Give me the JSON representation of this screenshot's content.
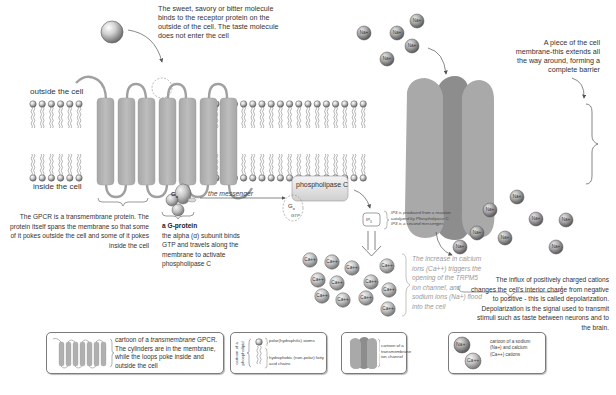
{
  "labels": {
    "outside_cell": "outside the cell",
    "inside_cell": "inside the cell",
    "phospholipase": "phospholipase C",
    "messenger": "the messenger",
    "g_alpha": "G",
    "g_alpha_sub": "α",
    "gtp": "GTP",
    "ip3": "IP",
    "ip3_sub": "3"
  },
  "annotations": {
    "taste_molecule": "The sweet, savory or bitter molecule binds to the receptor protein on the outside of the cell. The taste molecule does not enter the cell",
    "membrane_piece": "A piece of the cell membrane-this extends all the way around, forming a complete barrier",
    "gpcr": "The GPCR is a transmembrane protein. The protein itself spans the membrane so that some of it pokes outside the cell and some of it pokes inside the cell",
    "g_protein_title": "a G-protein",
    "g_protein_desc": "the alpha (α) subunit binds GTP and travels along the membrane to activate phospholipase C",
    "ip3_note": "IP3 is produced from a reaction catalyzed by Phospholipase C. IP3 is a second messenger.",
    "calcium_note": "The increase in calcium ions (Ca++) triggers the opening of the TRPM5 ion channel, and sodium ions (Na+) flood into the cell",
    "depolarization": "The influx of positively charged cations changes the cell's interior charge from negative to positive - this is called depolarization. Depolarization is the signal used to transmit stimuli such as taste between neurons and to the brain."
  },
  "ions": {
    "na": "Na+",
    "ca": "Ca++"
  },
  "legend": [
    {
      "id": "gpcr",
      "text_pre": "cartoon of a ",
      "text_em": "transmembrane",
      "text_post": " GPCR. The cylinders are in the membrane, while the loops poke inside and outside the cell"
    },
    {
      "id": "phospholipid",
      "side_label": "cartoon of a phospholipid",
      "polar": "polar(hydrophilic) atoms",
      "nonpolar": "hydrophobic (non-polar) fatty acid chains"
    },
    {
      "id": "ion-channel",
      "text": "cartoon of a transmembrane ion channel"
    },
    {
      "id": "cations",
      "text": "cartoon of a sodium (Na+) and calcium (Ca++) cations",
      "na": "Na+",
      "ca": "Ca++"
    }
  ],
  "colors": {
    "protein": "#b3b3b3",
    "channel_front": "#a9a9a9",
    "channel_back": "#8f8f8f",
    "head": "#c8c8c8",
    "text": "#333333",
    "note_gray": "#9a9a9a"
  }
}
